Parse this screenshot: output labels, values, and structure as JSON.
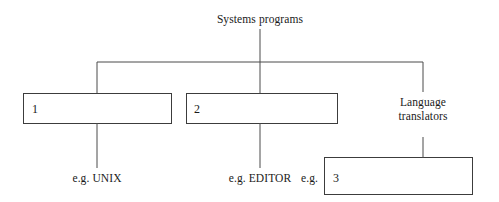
{
  "diagram": {
    "type": "tree",
    "root": {
      "id": "root",
      "label": "Systems programs"
    },
    "branches": [
      {
        "id": "branch-1",
        "box_label": "1",
        "example_prefix": "e.g. UNIX",
        "example_label": "e.g. UNIX"
      },
      {
        "id": "branch-2",
        "box_label": "2",
        "example_prefix": "e.g. EDITOR",
        "example_label": "e.g. EDITOR"
      },
      {
        "id": "branch-3",
        "label_line_1": "Language",
        "label_line_2": "translators",
        "example_prefix": "e.g.",
        "box_label": "3"
      }
    ],
    "colors": {
      "stroke": "#4a4a4a",
      "box_stroke": "#3c3c3c",
      "text": "#1a1a1a",
      "background": "#ffffff"
    }
  }
}
